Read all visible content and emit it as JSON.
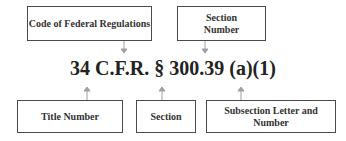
{
  "diagram": {
    "citation": "34 C.F.R. § 300.39 (a)(1)",
    "top_labels": [
      {
        "id": "cfr",
        "text": "Code of Federal Regulations"
      },
      {
        "id": "section-number",
        "text": "Section Number"
      }
    ],
    "bottom_labels": [
      {
        "id": "title-number",
        "text": "Title Number"
      },
      {
        "id": "section",
        "text": "Section"
      },
      {
        "id": "subsection",
        "text": "Subsection Letter and Number"
      }
    ],
    "arrow_color": "#a0a0a0",
    "border_color": "#4a4a4a"
  }
}
